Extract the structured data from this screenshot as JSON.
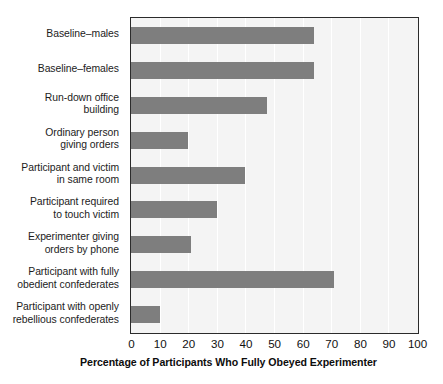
{
  "chart_data": {
    "type": "bar",
    "orientation": "horizontal",
    "title": "",
    "xlabel": "Percentage of Participants Who Fully Obeyed Experimenter",
    "ylabel": "",
    "xlim": [
      0,
      100
    ],
    "xticks": [
      0,
      10,
      20,
      30,
      40,
      50,
      60,
      70,
      80,
      90,
      100
    ],
    "grid": "vertical",
    "legend": "none",
    "bar_color": "#7e7e7e",
    "plot_background": "#f4f4f4",
    "categories": [
      "Baseline–males",
      "Baseline–females",
      "Run-down office\nbuilding",
      "Ordinary person\ngiving orders",
      "Participant and victim\nin same room",
      "Participant required\nto touch victim",
      "Experimenter giving\norders by phone",
      "Participant with fully\nobedient confederates",
      "Participant with openly\nrebellious confederates"
    ],
    "values": [
      64,
      64,
      47.5,
      20,
      40,
      30,
      21,
      71,
      10
    ]
  }
}
